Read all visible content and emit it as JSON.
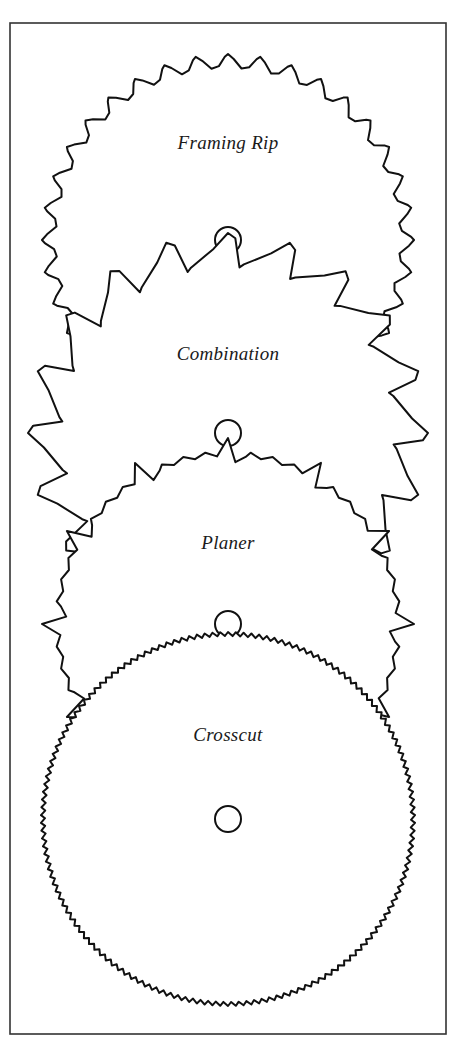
{
  "figure": {
    "width": 462,
    "height": 1048,
    "frame": {
      "x": 10,
      "y": 23,
      "width": 436,
      "height": 1011
    },
    "stroke_color": "#111111",
    "background": "#ffffff"
  },
  "blades": [
    {
      "id": "framing-rip",
      "label": "Framing Rip",
      "tooth_style": "hook-curl",
      "teeth": 36,
      "center": [
        228,
        240
      ],
      "radius": 186,
      "tooth_depth": 14,
      "arbor_radius": 13,
      "label_pos": [
        228,
        146
      ]
    },
    {
      "id": "combination",
      "label": "Combination",
      "tooth_style": "raker-gullet",
      "teeth": 20,
      "center": [
        228,
        433
      ],
      "radius": 200,
      "tooth_depth": 34,
      "arbor_radius": 13,
      "label_pos": [
        228,
        357
      ]
    },
    {
      "id": "planer",
      "label": "Planer",
      "tooth_style": "grouped-fine",
      "teeth": 48,
      "center": [
        228,
        624
      ],
      "radius": 186,
      "tooth_depth": 24,
      "arbor_radius": 13,
      "label_pos": [
        228,
        546
      ]
    },
    {
      "id": "crosscut",
      "label": "Crosscut",
      "tooth_style": "fine",
      "teeth": 150,
      "center": [
        228,
        819
      ],
      "radius": 187,
      "tooth_depth": 4,
      "arbor_radius": 13,
      "label_pos": [
        228,
        738
      ]
    }
  ]
}
